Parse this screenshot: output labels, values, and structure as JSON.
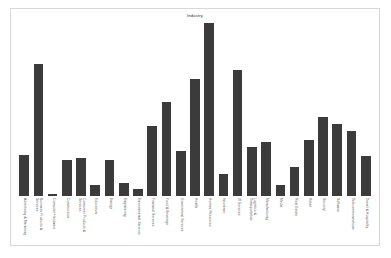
{
  "chart_data": {
    "type": "bar",
    "title": "Industry",
    "xlabel": "",
    "ylabel": "",
    "grid": false,
    "legend": false,
    "ylim": [
      0,
      100
    ],
    "categories": [
      "Advertising & Marketing",
      "Business Products & Services",
      "Computer Hardware",
      "Construction",
      "Consumer Products & Services",
      "Education",
      "Energy",
      "Engineering",
      "Environmental Services",
      "Financial Services",
      "Food & Beverage",
      "Government Services",
      "Health",
      "Human Resources",
      "Insurance",
      "IT Services",
      "Logistics & Transportation",
      "Manufacturing",
      "Media",
      "Real Estate",
      "Retail",
      "Security",
      "Software",
      "Telecommunications",
      "Travel & Hospitality"
    ],
    "category_lines": [
      [
        "Advertising & Marketing"
      ],
      [
        "Business Products &",
        "Services"
      ],
      [
        "Computer Hardware"
      ],
      [
        "Construction"
      ],
      [
        "Consumer Products &",
        "Services"
      ],
      [
        "Education"
      ],
      [
        "Energy"
      ],
      [
        "Engineering"
      ],
      [
        "Environmental Services"
      ],
      [
        "Financial Services"
      ],
      [
        "Food & Beverage"
      ],
      [
        "Government Services"
      ],
      [
        "Health"
      ],
      [
        "Human Resources"
      ],
      [
        "Insurance"
      ],
      [
        "IT Services"
      ],
      [
        "Logistics &",
        "Transportation"
      ],
      [
        "Manufacturing"
      ],
      [
        "Media"
      ],
      [
        "Real Estate"
      ],
      [
        "Retail"
      ],
      [
        "Security"
      ],
      [
        "Software"
      ],
      [
        "Telecommunications"
      ],
      [
        "Travel & Hospitality"
      ]
    ],
    "values": [
      23,
      73,
      1,
      20,
      21,
      6,
      20,
      7,
      4,
      39,
      52,
      25,
      65,
      96,
      12,
      70,
      27,
      30,
      6,
      16,
      31,
      44,
      40,
      36,
      22
    ],
    "bar_color": "#3b3b3b"
  },
  "bottom_strip": {
    "text": ""
  }
}
